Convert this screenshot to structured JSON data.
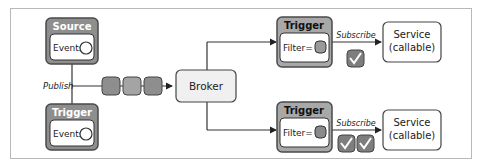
{
  "source": {
    "title": "Source",
    "inner": "Events"
  },
  "left_trigger": {
    "title": "Trigger",
    "inner": "Events"
  },
  "publish_label": "Publish",
  "broker": {
    "label": "Broker"
  },
  "triggers": [
    {
      "title": "Trigger",
      "inner": "Filter=",
      "subscribe_label": "Subscribe",
      "service": [
        "Service",
        "(callable)"
      ],
      "checks": 1
    },
    {
      "title": "Trigger",
      "inner": "Filter=",
      "subscribe_label": "Subscribe",
      "service": [
        "Service",
        "(callable)"
      ],
      "checks": 2
    }
  ],
  "events_queue_count": 3,
  "colors": {
    "header_fill": "#8e8e8e",
    "box_stroke": "#4a4a4a",
    "event_fill": "#9a9a9a",
    "check_fill": "#7e7e7e",
    "broker_fill": "#f0f0f0"
  }
}
